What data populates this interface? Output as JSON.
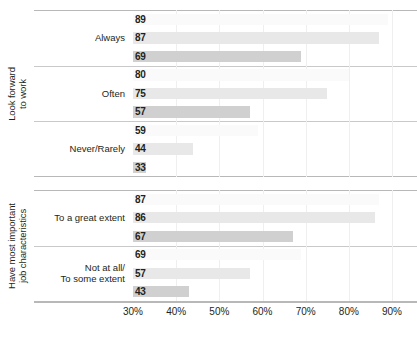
{
  "chart_data": {
    "type": "bar",
    "orientation": "horizontal",
    "title": "",
    "xlabel": "",
    "ylabel": "",
    "xlim": [
      30,
      90
    ],
    "x_ticks": [
      "30%",
      "40%",
      "50%",
      "60%",
      "70%",
      "80%",
      "90%"
    ],
    "x_tick_values": [
      30,
      40,
      50,
      60,
      70,
      80,
      90
    ],
    "grid": true,
    "grid_axis": "x",
    "legend_position": "none",
    "series": [
      {
        "name": "series-1",
        "color": "#fafafa",
        "values": [
          89,
          80,
          59,
          87,
          69
        ]
      },
      {
        "name": "series-2",
        "color": "#e8e8e8",
        "values": [
          87,
          75,
          44,
          86,
          57
        ]
      },
      {
        "name": "series-3",
        "color": "#d0d0d0",
        "values": [
          69,
          57,
          33,
          67,
          43
        ]
      }
    ],
    "categories": [
      "Always",
      "Often",
      "Never/Rarely",
      "To a great extent",
      "Not at all/ To some extent"
    ],
    "groups": [
      {
        "label": "Look forward to work",
        "categories": [
          {
            "label_lines": [
              "Always"
            ],
            "values": [
              89,
              87,
              69
            ]
          },
          {
            "label_lines": [
              "Often"
            ],
            "values": [
              80,
              75,
              57
            ]
          },
          {
            "label_lines": [
              "Never/Rarely"
            ],
            "values": [
              59,
              44,
              33
            ]
          }
        ]
      },
      {
        "label": "Have most important job characteristics",
        "categories": [
          {
            "label_lines": [
              "To a great extent"
            ],
            "values": [
              87,
              86,
              67
            ]
          },
          {
            "label_lines": [
              "Not at all/",
              "To some extent"
            ],
            "values": [
              69,
              57,
              43
            ]
          }
        ]
      }
    ]
  },
  "axis": {
    "group_labels": [
      {
        "line1": "Look forward",
        "line2": "to work"
      },
      {
        "line1": "Have most important",
        "line2": "job characteristics"
      }
    ]
  },
  "footnote": {
    "text": ""
  }
}
